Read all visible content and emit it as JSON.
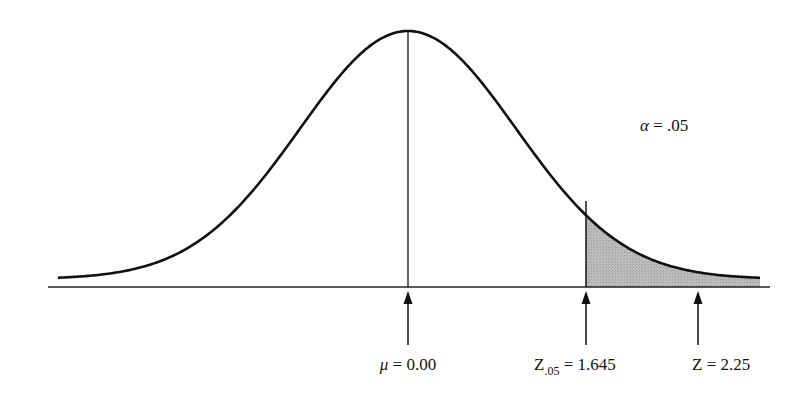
{
  "diagram": {
    "type": "normal-distribution-one-tailed-test",
    "alpha_label": {
      "symbol": "α",
      "text": " = .05"
    },
    "markers": [
      {
        "id": "mean",
        "symbol": "μ",
        "text": " = 0.00",
        "x": 408
      },
      {
        "id": "critical",
        "symbol": "Z",
        "subscript": ".05",
        "text": " = 1.645",
        "x": 586
      },
      {
        "id": "test-stat",
        "symbol": "Z",
        "text": " = 2.25",
        "x": 698
      }
    ],
    "shaded_region": {
      "from_x": 586,
      "to_x": 760,
      "fill": "#b9b9b9"
    },
    "colors": {
      "line": "#111111",
      "shade": "#b9b9b9",
      "background": "#ffffff"
    }
  }
}
